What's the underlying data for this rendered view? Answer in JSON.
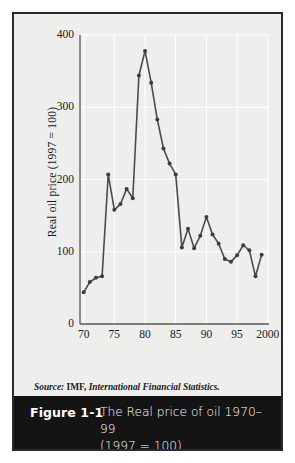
{
  "figure": {
    "number_label": "Figure 1-1",
    "caption_line1": "The Real price of oil 1970–99",
    "caption_line2": "(1997 = 100)",
    "source_prefix": "Source:",
    "source_org": "IMF,",
    "source_publication": "International Financial Statistics.",
    "frame_color": "#2b2b2b",
    "panel_bg": "#eeeeec",
    "caption_bg": "#141414",
    "caption_fg": "#ffffff"
  },
  "chart_data": {
    "type": "line",
    "title": "The Real price of oil 1970–99 (1997 = 100)",
    "xlabel": "",
    "ylabel": "Real oil price (1997 = 100)",
    "xlim": [
      1969.4,
      2000.2
    ],
    "ylim": [
      0,
      400
    ],
    "grid": true,
    "legend": null,
    "line_color": "#4a4a52",
    "marker_color": "#3c3c44",
    "marker": "circle",
    "y_ticks": [
      0,
      100,
      200,
      300,
      400
    ],
    "y_tick_labels": [
      "0",
      "100",
      "200",
      "300",
      "400"
    ],
    "x_ticks": [
      1970,
      1975,
      1980,
      1985,
      1990,
      1995,
      2000
    ],
    "x_tick_labels": [
      "70",
      "75",
      "80",
      "85",
      "90",
      "95",
      "2000"
    ],
    "x": [
      1970,
      1971,
      1972,
      1973,
      1974,
      1975,
      1976,
      1977,
      1978,
      1979,
      1980,
      1981,
      1982,
      1983,
      1984,
      1985,
      1986,
      1987,
      1988,
      1989,
      1990,
      1991,
      1992,
      1993,
      1994,
      1995,
      1996,
      1997,
      1998,
      1999
    ],
    "values": [
      44,
      58,
      64,
      66,
      207,
      158,
      166,
      187,
      174,
      344,
      378,
      334,
      283,
      243,
      222,
      207,
      106,
      132,
      105,
      122,
      148,
      124,
      111,
      90,
      86,
      95,
      109,
      102,
      66,
      96
    ],
    "series": [
      {
        "name": "Real oil price (1997 = 100)",
        "values": [
          44,
          58,
          64,
          66,
          207,
          158,
          166,
          187,
          174,
          344,
          378,
          334,
          283,
          243,
          222,
          207,
          106,
          132,
          105,
          122,
          148,
          124,
          111,
          90,
          86,
          95,
          109,
          102,
          66,
          96
        ]
      }
    ],
    "annotations": []
  }
}
